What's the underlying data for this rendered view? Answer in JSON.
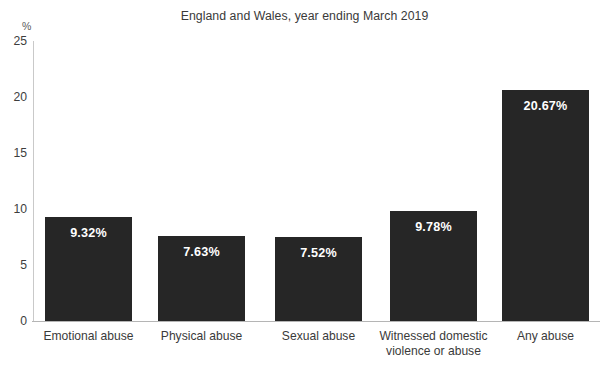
{
  "chart_data": {
    "type": "bar",
    "title": "",
    "subtitle": "England and Wales, year ending March 2019",
    "categories": [
      "Emotional abuse",
      "Physical abuse",
      "Sexual abuse",
      "Witnessed domestic\nviolence or abuse",
      "Any abuse"
    ],
    "values": [
      9.32,
      7.63,
      7.52,
      9.78,
      20.67
    ],
    "data_labels": [
      "9.32%",
      "7.63%",
      "7.52%",
      "9.78%",
      "20.67%"
    ],
    "xlabel": "",
    "ylabel": "",
    "yunit": "%",
    "ylim": [
      0,
      25
    ],
    "yticks": [
      0,
      5,
      10,
      15,
      20,
      25
    ],
    "ytick_labels": [
      "0",
      "5",
      "10",
      "15",
      "20",
      "25"
    ],
    "grid": false,
    "legend": false,
    "legend_position": "none",
    "series": [
      {
        "name": "Prevalence",
        "values": [
          9.32,
          7.63,
          7.52,
          9.78,
          20.67
        ]
      }
    ],
    "colors": {
      "bar": "#262626",
      "data_label": "#ffffff",
      "axis": "#b5b5b5",
      "y_axis": "#c9c9c9",
      "tick_text": "#3d3d3d",
      "background": "#ffffff"
    }
  }
}
